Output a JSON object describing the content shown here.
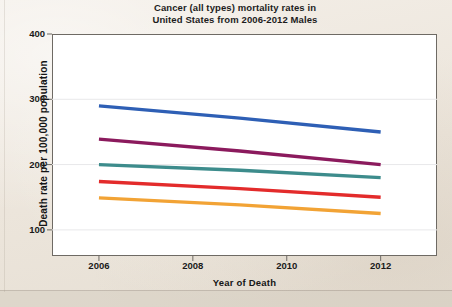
{
  "chart_data": {
    "type": "line",
    "title": "Cancer (all types) mortality rates in United States from 2006-2012 Males",
    "title_lines": [
      "Cancer (all types) mortality rates in",
      "United States from 2006-2012 Males"
    ],
    "xlabel": "Year of Death",
    "ylabel": "Death rate per 100,000 population",
    "x": [
      2006,
      2012
    ],
    "xlim": [
      2005.0,
      2013.2
    ],
    "ylim": [
      60,
      400
    ],
    "xticks": [
      2006,
      2008,
      2010,
      2012
    ],
    "xtick_labels": [
      "2006",
      "2008",
      "2010",
      "2012"
    ],
    "yticks": [
      100,
      200,
      300,
      400
    ],
    "ytick_labels": [
      "100",
      "200",
      "300",
      "400"
    ],
    "grid": true,
    "legend": "none",
    "series": [
      {
        "name": "series-1",
        "color": "#2e5fb5",
        "values": [
          290,
          250
        ]
      },
      {
        "name": "series-2",
        "color": "#8b1a5d",
        "values": [
          239,
          200
        ]
      },
      {
        "name": "series-3",
        "color": "#3d8c8c",
        "values": [
          200,
          180
        ]
      },
      {
        "name": "series-4",
        "color": "#e32b2b",
        "values": [
          174,
          150
        ]
      },
      {
        "name": "series-5",
        "color": "#f2a335",
        "values": [
          149,
          125
        ]
      }
    ]
  },
  "colors": {
    "paper": "#efe9e1",
    "plot_background": "#ffffff",
    "axis": "#6e6a64",
    "grid": "#e8e8ea",
    "text": "#1a1a1a"
  }
}
